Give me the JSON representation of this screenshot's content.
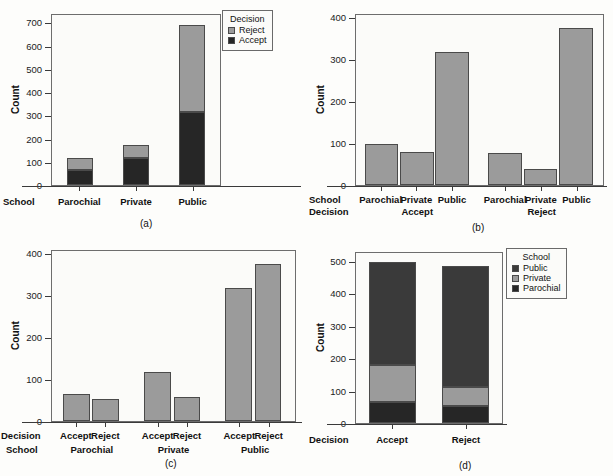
{
  "figure": {
    "background": "#fdfdfb",
    "colors": {
      "dark": "#262626",
      "gray": "#9b9b9b",
      "box_border": "#6d6d6d",
      "axis": "#3a3a3a"
    }
  },
  "panels": [
    {
      "id": "a",
      "caption": "(a)",
      "ylabel": "Count",
      "yticks": [
        0,
        100,
        200,
        300,
        400,
        500,
        600,
        700
      ],
      "ylim": [
        0,
        740
      ],
      "row_names": [
        "School"
      ],
      "legend": {
        "title": "Decision",
        "items": [
          {
            "label": "Reject",
            "color": "#9b9b9b"
          },
          {
            "label": "Accept",
            "color": "#262626"
          }
        ]
      },
      "chart_data": {
        "type": "bar",
        "stacked": true,
        "title": "(a)",
        "xlabel": "School",
        "ylabel": "Count",
        "ylim": [
          0,
          740
        ],
        "yticks": [
          0,
          100,
          200,
          300,
          400,
          500,
          600,
          700
        ],
        "categories": [
          "Parochial",
          "Private",
          "Public"
        ],
        "series": [
          {
            "name": "Accept",
            "color": "#262626",
            "values": [
              64,
              118,
              320
            ]
          },
          {
            "name": "Reject",
            "color": "#9b9b9b",
            "values": [
              54,
              58,
              378
            ]
          }
        ],
        "totals": [
          118,
          176,
          698
        ],
        "legend": "top-right outside",
        "grid": false
      }
    },
    {
      "id": "b",
      "caption": "(b)",
      "ylabel": "Count",
      "yticks": [
        0,
        100,
        200,
        300,
        400
      ],
      "ylim": [
        0,
        410
      ],
      "row_names": [
        "School",
        "Decision"
      ],
      "chart_data": {
        "type": "bar",
        "stacked": false,
        "title": "(b)",
        "xlabel": "School / Decision",
        "ylabel": "Count",
        "ylim": [
          0,
          410
        ],
        "yticks": [
          0,
          100,
          200,
          300,
          400
        ],
        "groups": [
          {
            "decision": "Accept",
            "categories": [
              "Parochial",
              "Private",
              "Public"
            ],
            "values": [
              100,
              79,
              320
            ]
          },
          {
            "decision": "Reject",
            "categories": [
              "Parochial",
              "Private",
              "Public"
            ],
            "values": [
              78,
              38,
              378
            ]
          }
        ],
        "bar_color": "#9b9b9b",
        "grid": false
      }
    },
    {
      "id": "c",
      "caption": "(c)",
      "ylabel": "Count",
      "yticks": [
        0,
        100,
        200,
        300,
        400
      ],
      "ylim": [
        0,
        410
      ],
      "row_names": [
        "Decision",
        "School"
      ],
      "chart_data": {
        "type": "bar",
        "stacked": false,
        "title": "(c)",
        "xlabel": "Decision / School",
        "ylabel": "Count",
        "ylim": [
          0,
          410
        ],
        "yticks": [
          0,
          100,
          200,
          300,
          400
        ],
        "groups": [
          {
            "school": "Parochial",
            "categories": [
              "Accept",
              "Reject"
            ],
            "values": [
              64,
              54
            ]
          },
          {
            "school": "Private",
            "categories": [
              "Accept",
              "Reject"
            ],
            "values": [
              118,
              58
            ]
          },
          {
            "school": "Public",
            "categories": [
              "Accept",
              "Reject"
            ],
            "values": [
              320,
              378
            ]
          }
        ],
        "bar_color": "#9b9b9b",
        "grid": false
      }
    },
    {
      "id": "d",
      "caption": "(d)",
      "ylabel": "Count",
      "yticks": [
        0,
        100,
        200,
        300,
        400,
        500
      ],
      "ylim": [
        0,
        530
      ],
      "row_names": [
        "Decision"
      ],
      "legend": {
        "title": "School",
        "items": [
          {
            "label": "Public",
            "color": "#3a3a3a"
          },
          {
            "label": "Private",
            "color": "#9b9b9b"
          },
          {
            "label": "Parochial",
            "color": "#262626"
          }
        ]
      },
      "chart_data": {
        "type": "bar",
        "stacked": true,
        "title": "(d)",
        "xlabel": "Decision",
        "ylabel": "Count",
        "ylim": [
          0,
          530
        ],
        "yticks": [
          0,
          100,
          200,
          300,
          400,
          500
        ],
        "categories": [
          "Accept",
          "Reject"
        ],
        "series": [
          {
            "name": "Parochial",
            "color": "#262626",
            "values": [
              64,
              54
            ]
          },
          {
            "name": "Private",
            "color": "#9b9b9b",
            "values": [
              118,
              58
            ]
          },
          {
            "name": "Public",
            "color": "#3a3a3a",
            "values": [
              320,
              378
            ]
          }
        ],
        "totals": [
          502,
          490
        ],
        "legend": "top-right outside",
        "grid": false
      }
    }
  ]
}
